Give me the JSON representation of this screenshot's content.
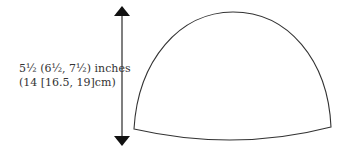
{
  "diagram": {
    "type": "hat-schematic",
    "measurement": {
      "line1": "5½  (6½, 7½) inches",
      "line2": "(14 [16.5, 19]cm)"
    },
    "arrow": {
      "direction": "vertical-double"
    },
    "shape": "dome"
  }
}
